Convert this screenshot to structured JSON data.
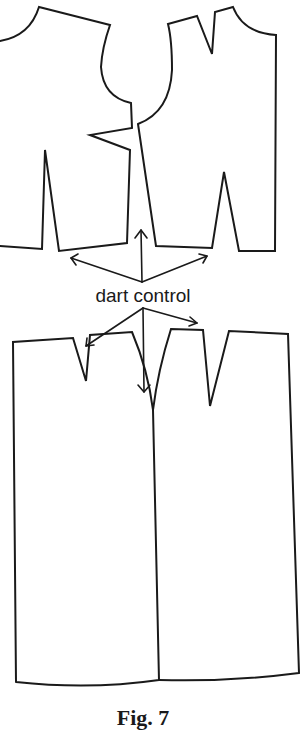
{
  "figure": {
    "label": "dart control",
    "caption": "Fig. 7",
    "stroke_color": "#1a1a1a",
    "background_color": "#ffffff",
    "pieces": [
      {
        "name": "left-bodice",
        "description": "bodice pattern piece with side dart and waist dart"
      },
      {
        "name": "right-bodice",
        "description": "bodice pattern piece with shoulder dart and waist dart"
      },
      {
        "name": "left-skirt",
        "description": "skirt pattern piece with waist dart"
      },
      {
        "name": "right-skirt",
        "description": "skirt pattern piece with waist dart"
      }
    ],
    "arrows": {
      "upper_group": [
        "up",
        "left",
        "right"
      ],
      "lower_group": [
        "left",
        "down",
        "right"
      ]
    }
  }
}
